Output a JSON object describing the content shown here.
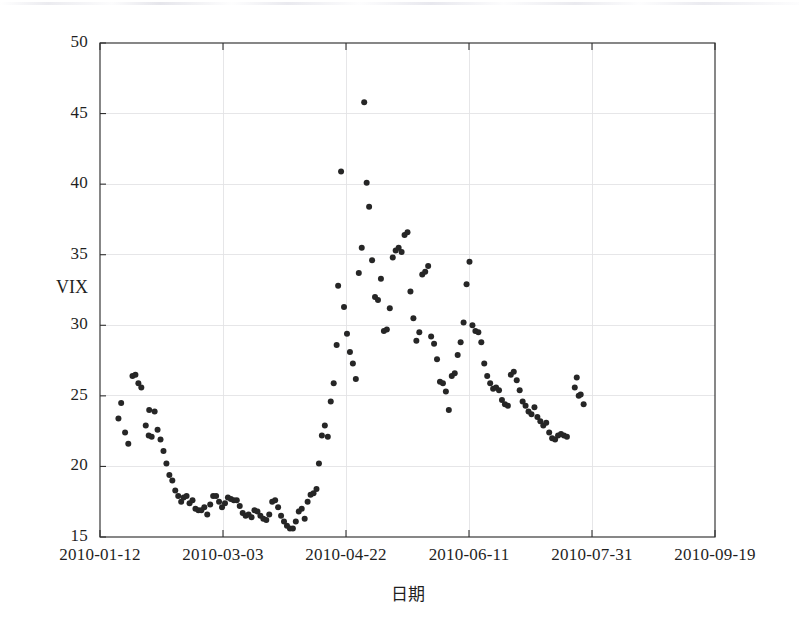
{
  "chart_data": {
    "type": "scatter",
    "title": "",
    "xlabel": "日期",
    "ylabel": "VIX",
    "ylim": [
      15,
      50
    ],
    "yticks": [
      15,
      20,
      25,
      30,
      35,
      40,
      45,
      50
    ],
    "ytick_labels": [
      "15",
      "20",
      "25",
      "30",
      "35",
      "40",
      "45",
      "50"
    ],
    "xlim": [
      0,
      250
    ],
    "xticks": [
      0,
      50,
      100,
      150,
      200,
      250
    ],
    "xtick_labels": [
      "2010-01-12",
      "2010-03-03",
      "2010-04-22",
      "2010-06-11",
      "2010-07-31",
      "2010-09-19"
    ],
    "grid": true,
    "legend": null,
    "marker": {
      "shape": "circle",
      "color": "#262626",
      "size_px": 6
    },
    "series": [
      {
        "name": "VIX",
        "points": [
          [
            7.5,
            23.4
          ],
          [
            8.6,
            24.5
          ],
          [
            10.2,
            22.4
          ],
          [
            11.5,
            21.6
          ],
          [
            13.2,
            26.4
          ],
          [
            14.4,
            26.5
          ],
          [
            15.6,
            25.9
          ],
          [
            16.8,
            25.6
          ],
          [
            18.6,
            22.9
          ],
          [
            19.8,
            22.2
          ],
          [
            21.0,
            22.1
          ],
          [
            20.0,
            24.0
          ],
          [
            22.2,
            23.9
          ],
          [
            23.4,
            22.6
          ],
          [
            24.6,
            21.9
          ],
          [
            25.8,
            21.1
          ],
          [
            27.0,
            20.2
          ],
          [
            28.2,
            19.4
          ],
          [
            29.4,
            19.0
          ],
          [
            30.6,
            18.3
          ],
          [
            31.8,
            17.9
          ],
          [
            33.0,
            17.5
          ],
          [
            34.0,
            17.8
          ],
          [
            35.2,
            17.9
          ],
          [
            36.4,
            17.4
          ],
          [
            37.6,
            17.6
          ],
          [
            38.8,
            17.0
          ],
          [
            40.0,
            16.9
          ],
          [
            41.2,
            16.9
          ],
          [
            42.4,
            17.1
          ],
          [
            43.6,
            16.6
          ],
          [
            44.8,
            17.3
          ],
          [
            46.0,
            17.9
          ],
          [
            47.2,
            17.9
          ],
          [
            48.4,
            17.5
          ],
          [
            49.6,
            17.1
          ],
          [
            50.8,
            17.4
          ],
          [
            52.0,
            17.8
          ],
          [
            53.2,
            17.7
          ],
          [
            54.4,
            17.6
          ],
          [
            55.6,
            17.6
          ],
          [
            56.8,
            17.2
          ],
          [
            58.0,
            16.7
          ],
          [
            59.2,
            16.5
          ],
          [
            60.4,
            16.6
          ],
          [
            61.6,
            16.4
          ],
          [
            62.8,
            16.9
          ],
          [
            64.0,
            16.8
          ],
          [
            65.2,
            16.5
          ],
          [
            66.4,
            16.3
          ],
          [
            67.6,
            16.2
          ],
          [
            68.8,
            16.6
          ],
          [
            70.0,
            17.5
          ],
          [
            71.2,
            17.6
          ],
          [
            72.4,
            17.1
          ],
          [
            73.6,
            16.5
          ],
          [
            74.8,
            16.1
          ],
          [
            76.0,
            15.8
          ],
          [
            77.2,
            15.6
          ],
          [
            78.4,
            15.6
          ],
          [
            79.6,
            16.1
          ],
          [
            80.8,
            16.8
          ],
          [
            82.0,
            17.0
          ],
          [
            83.2,
            16.3
          ],
          [
            84.4,
            17.5
          ],
          [
            85.6,
            18.0
          ],
          [
            86.8,
            18.1
          ],
          [
            88.0,
            18.4
          ],
          [
            89.0,
            20.2
          ],
          [
            90.2,
            22.2
          ],
          [
            91.4,
            22.9
          ],
          [
            92.6,
            22.1
          ],
          [
            93.8,
            24.6
          ],
          [
            95.0,
            25.9
          ],
          [
            96.2,
            28.6
          ],
          [
            96.8,
            32.8
          ],
          [
            98.0,
            40.9
          ],
          [
            99.2,
            31.3
          ],
          [
            100.4,
            29.4
          ],
          [
            101.6,
            28.1
          ],
          [
            102.8,
            27.3
          ],
          [
            104.0,
            26.2
          ],
          [
            105.2,
            33.7
          ],
          [
            106.4,
            35.5
          ],
          [
            107.4,
            45.8
          ],
          [
            108.4,
            40.1
          ],
          [
            109.4,
            38.4
          ],
          [
            110.6,
            34.6
          ],
          [
            111.8,
            32.0
          ],
          [
            113.0,
            31.8
          ],
          [
            114.2,
            33.3
          ],
          [
            115.4,
            29.6
          ],
          [
            116.6,
            29.7
          ],
          [
            117.8,
            31.2
          ],
          [
            119.0,
            34.8
          ],
          [
            120.2,
            35.3
          ],
          [
            121.4,
            35.5
          ],
          [
            122.6,
            35.2
          ],
          [
            123.8,
            36.4
          ],
          [
            125.0,
            36.6
          ],
          [
            126.2,
            32.4
          ],
          [
            127.4,
            30.5
          ],
          [
            128.6,
            28.9
          ],
          [
            129.8,
            29.5
          ],
          [
            131.0,
            33.6
          ],
          [
            132.2,
            33.8
          ],
          [
            133.4,
            34.2
          ],
          [
            134.6,
            29.2
          ],
          [
            135.8,
            28.7
          ],
          [
            137.0,
            27.6
          ],
          [
            138.2,
            26.0
          ],
          [
            139.4,
            25.9
          ],
          [
            140.6,
            25.3
          ],
          [
            141.8,
            24.0
          ],
          [
            143.0,
            26.4
          ],
          [
            144.2,
            26.6
          ],
          [
            145.4,
            27.9
          ],
          [
            146.6,
            28.8
          ],
          [
            147.8,
            30.2
          ],
          [
            149.0,
            32.9
          ],
          [
            150.2,
            34.5
          ],
          [
            151.4,
            30.0
          ],
          [
            152.6,
            29.6
          ],
          [
            153.8,
            29.5
          ],
          [
            155.0,
            28.8
          ],
          [
            156.2,
            27.3
          ],
          [
            157.4,
            26.4
          ],
          [
            158.6,
            25.9
          ],
          [
            159.8,
            25.5
          ],
          [
            161.0,
            25.6
          ],
          [
            162.2,
            25.4
          ],
          [
            163.4,
            24.7
          ],
          [
            164.6,
            24.4
          ],
          [
            165.8,
            24.3
          ],
          [
            167.0,
            26.5
          ],
          [
            168.2,
            26.7
          ],
          [
            169.4,
            26.1
          ],
          [
            170.6,
            25.4
          ],
          [
            171.8,
            24.6
          ],
          [
            173.0,
            24.3
          ],
          [
            174.2,
            23.9
          ],
          [
            175.4,
            23.7
          ],
          [
            176.6,
            24.2
          ],
          [
            177.8,
            23.5
          ],
          [
            179.0,
            23.2
          ],
          [
            180.2,
            22.9
          ],
          [
            181.4,
            23.1
          ],
          [
            182.6,
            22.4
          ],
          [
            183.8,
            22.0
          ],
          [
            185.0,
            21.9
          ],
          [
            186.2,
            22.2
          ],
          [
            187.4,
            22.3
          ],
          [
            188.6,
            22.2
          ],
          [
            189.8,
            22.1
          ],
          [
            193.0,
            25.6
          ],
          [
            193.8,
            26.3
          ],
          [
            194.6,
            25.0
          ],
          [
            195.4,
            25.1
          ],
          [
            196.6,
            24.4
          ]
        ]
      }
    ]
  },
  "geometry": {
    "plot_left": 100,
    "plot_right": 715,
    "plot_top": 43,
    "plot_bottom": 537
  }
}
